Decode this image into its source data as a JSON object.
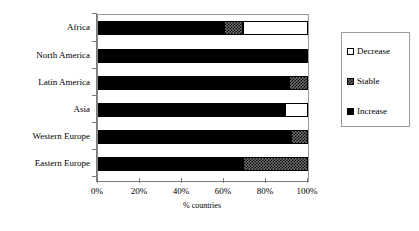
{
  "chart_data": {
    "type": "bar",
    "orientation": "horizontal",
    "stacked": true,
    "stack_total": 100,
    "title": "",
    "xlabel": "% countries",
    "ylabel": "",
    "xlim": [
      0,
      100
    ],
    "xticks": [
      "0%",
      "20%",
      "40%",
      "60%",
      "80%",
      "100%"
    ],
    "xtick_values": [
      0,
      20,
      40,
      60,
      80,
      100
    ],
    "grid": false,
    "legend_position": "right",
    "categories": [
      "Africa",
      "North America",
      "Latin America",
      "Asia",
      "Western Europe",
      "Eastern Europe"
    ],
    "series": [
      {
        "name": "Increase",
        "color": "#000000",
        "pattern": "solid-black",
        "values": [
          60,
          100,
          91,
          89,
          92,
          69
        ]
      },
      {
        "name": "Stable",
        "color": "#6f6f6f",
        "pattern": "checker-gray",
        "values": [
          9,
          0,
          9,
          0,
          8,
          31
        ]
      },
      {
        "name": "Decrease",
        "color": "#ffffff",
        "pattern": "solid-white",
        "values": [
          31,
          0,
          0,
          11,
          0,
          0
        ]
      }
    ],
    "legend_entries": [
      "Decrease",
      "Stable",
      "Increase"
    ]
  }
}
